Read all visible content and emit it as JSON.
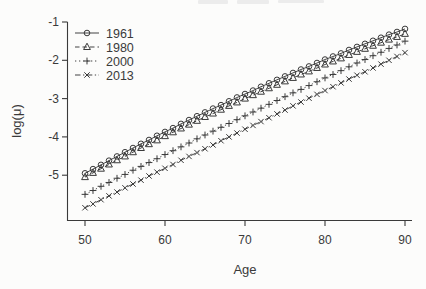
{
  "figure": {
    "ink_color": "#3a3a3a",
    "background": "#fcfcfb",
    "artifact_color": "#ececec"
  },
  "chart_data": {
    "type": "line",
    "title": "",
    "xlabel": "Age",
    "ylabel": "log(μ)",
    "grid": false,
    "legend_position": "top-left",
    "xlim": [
      48,
      92
    ],
    "ylim": [
      -6.1,
      -0.95
    ],
    "x_ticks": [
      50,
      60,
      70,
      80,
      90
    ],
    "x_tick_labels": [
      "50",
      "60",
      "70",
      "80",
      "90"
    ],
    "y_ticks": [
      -1,
      -2,
      -3,
      -4,
      -5
    ],
    "y_tick_labels": [
      "-1",
      "-2",
      "-3",
      "-4",
      "-5"
    ],
    "x": [
      50,
      51,
      52,
      53,
      54,
      55,
      56,
      57,
      58,
      59,
      60,
      61,
      62,
      63,
      64,
      65,
      66,
      67,
      68,
      69,
      70,
      71,
      72,
      73,
      74,
      75,
      76,
      77,
      78,
      79,
      80,
      81,
      82,
      83,
      84,
      85,
      86,
      87,
      88,
      89,
      90
    ],
    "series": [
      {
        "name": "1961",
        "marker": "circle",
        "line_style": "solid",
        "values": [
          -4.95,
          -4.84,
          -4.73,
          -4.62,
          -4.51,
          -4.4,
          -4.29,
          -4.18,
          -4.08,
          -3.97,
          -3.87,
          -3.77,
          -3.66,
          -3.56,
          -3.46,
          -3.36,
          -3.26,
          -3.17,
          -3.07,
          -2.97,
          -2.88,
          -2.79,
          -2.69,
          -2.6,
          -2.51,
          -2.42,
          -2.33,
          -2.24,
          -2.16,
          -2.07,
          -1.98,
          -1.9,
          -1.82,
          -1.73,
          -1.65,
          -1.57,
          -1.49,
          -1.41,
          -1.33,
          -1.26,
          -1.18
        ]
      },
      {
        "name": "1980",
        "marker": "triangle",
        "line_style": "dashed",
        "values": [
          -5.05,
          -4.94,
          -4.83,
          -4.72,
          -4.61,
          -4.51,
          -4.4,
          -4.29,
          -4.19,
          -4.09,
          -3.98,
          -3.88,
          -3.78,
          -3.68,
          -3.58,
          -3.48,
          -3.39,
          -3.29,
          -3.19,
          -3.1,
          -3.0,
          -2.91,
          -2.82,
          -2.73,
          -2.64,
          -2.55,
          -2.46,
          -2.37,
          -2.29,
          -2.2,
          -2.11,
          -2.03,
          -1.95,
          -1.86,
          -1.78,
          -1.7,
          -1.62,
          -1.54,
          -1.46,
          -1.39,
          -1.31
        ]
      },
      {
        "name": "2000",
        "marker": "plus",
        "line_style": "dotted",
        "values": [
          -5.5,
          -5.4,
          -5.29,
          -5.19,
          -5.08,
          -4.98,
          -4.87,
          -4.77,
          -4.67,
          -4.57,
          -4.46,
          -4.36,
          -4.26,
          -4.16,
          -4.05,
          -3.95,
          -3.85,
          -3.75,
          -3.65,
          -3.55,
          -3.45,
          -3.35,
          -3.25,
          -3.15,
          -3.05,
          -2.95,
          -2.85,
          -2.76,
          -2.66,
          -2.56,
          -2.46,
          -2.37,
          -2.27,
          -2.17,
          -2.07,
          -1.98,
          -1.88,
          -1.79,
          -1.69,
          -1.6,
          -1.5
        ]
      },
      {
        "name": "2013",
        "marker": "x",
        "line_style": "dashdot",
        "values": [
          -5.85,
          -5.75,
          -5.64,
          -5.54,
          -5.44,
          -5.33,
          -5.23,
          -5.13,
          -5.02,
          -4.92,
          -4.82,
          -4.72,
          -4.61,
          -4.51,
          -4.41,
          -4.31,
          -4.21,
          -4.1,
          -4.0,
          -3.9,
          -3.8,
          -3.7,
          -3.6,
          -3.5,
          -3.4,
          -3.3,
          -3.19,
          -3.09,
          -2.99,
          -2.89,
          -2.79,
          -2.69,
          -2.59,
          -2.49,
          -2.39,
          -2.3,
          -2.2,
          -2.1,
          -2.0,
          -1.9,
          -1.8
        ]
      }
    ]
  }
}
